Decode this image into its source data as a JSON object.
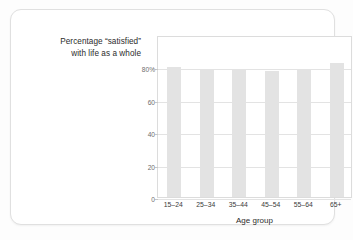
{
  "card": {
    "background_color": "#ffffff",
    "border_color": "#e0e0e0"
  },
  "figure": {
    "title_line1": "Percentage “satisfied”",
    "title_line2": "with life as a whole"
  },
  "chart_data": {
    "type": "bar",
    "title": "Percentage “satisfied” with life as a whole",
    "xlabel": "Age group",
    "ylabel": "",
    "categories": [
      "15–24",
      "25–34",
      "35–44",
      "45–54",
      "55–64",
      "65+"
    ],
    "values": [
      80,
      78.5,
      78.5,
      78,
      78.5,
      82.5
    ],
    "ylim": [
      0,
      100
    ],
    "yticks": [
      0,
      20,
      40,
      60,
      80
    ],
    "ytick_labels": [
      "0",
      "20",
      "40",
      "60",
      "80%"
    ],
    "grid": true,
    "legend": "none",
    "bar_color": "#e3e3e3",
    "gridline_color": "#e3e3e3",
    "axis_color": "#dcdcdc"
  }
}
